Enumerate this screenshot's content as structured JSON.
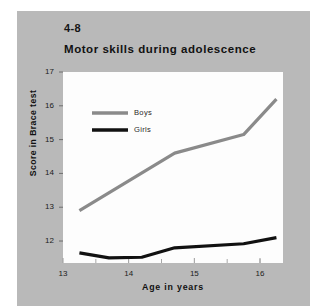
{
  "figure": {
    "number": "4-8",
    "title": "Motor skills during adolescence",
    "panel_color": "#b9b9b9",
    "plot_background": "#fdfdfd"
  },
  "chart_data": {
    "type": "line",
    "title": "Motor skills during adolescence",
    "xlabel": "Age in years",
    "ylabel": "Score in Brace test",
    "xlim": [
      13,
      16.35
    ],
    "ylim": [
      11.35,
      17
    ],
    "xticks": [
      13,
      14,
      15,
      16
    ],
    "xtick_labels": [
      "13",
      "14",
      "15",
      "16"
    ],
    "xminor_ticks": [
      13.5,
      14.5,
      15.5,
      16.0
    ],
    "yticks": [
      12,
      13,
      14,
      15,
      16,
      17
    ],
    "ytick_labels": [
      "12",
      "13",
      "14",
      "15",
      "16",
      "17"
    ],
    "grid": false,
    "legend_position": "top-left",
    "series": [
      {
        "name": "Boys",
        "color": "#8a8a8a",
        "width": 3.2,
        "x": [
          13.25,
          14.7,
          15.75,
          16.25
        ],
        "values": [
          12.9,
          14.6,
          15.15,
          16.2
        ]
      },
      {
        "name": "Girls",
        "color": "#111111",
        "width": 3.2,
        "x": [
          13.25,
          13.7,
          14.2,
          14.7,
          15.75,
          16.25
        ],
        "values": [
          11.65,
          11.5,
          11.52,
          11.8,
          11.92,
          12.1
        ]
      }
    ]
  }
}
